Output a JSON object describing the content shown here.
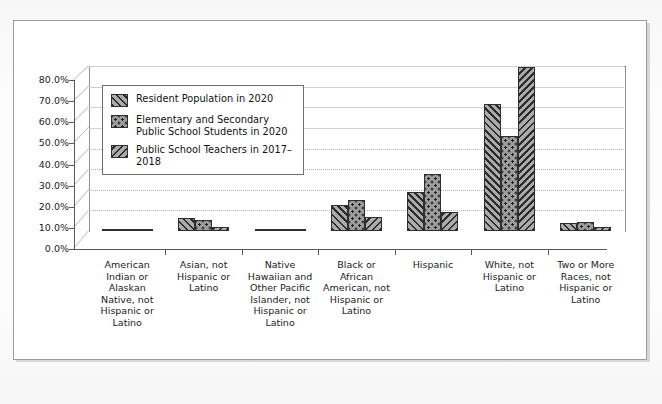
{
  "chart_data": {
    "type": "bar",
    "title": "",
    "xlabel": "",
    "ylabel": "",
    "ylim": [
      0,
      80
    ],
    "grid": true,
    "legend_position": "upper-left-inside",
    "y_ticks": [
      "0.0%",
      "10.0%",
      "20.0%",
      "30.0%",
      "40.0%",
      "50.0%",
      "60.0%",
      "70.0%",
      "80.0%"
    ],
    "categories": [
      "American Indian or Alaskan Native, not Hispanic or Latino",
      "Asian, not Hispanic or Latino",
      "Native Hawaiian and Other Pacific Islander, not Hispanic or Latino",
      "Black or African American, not Hispanic or Latino",
      "Hispanic",
      "White, not Hispanic or Latino",
      "Two or More Races, not Hispanic or Latino"
    ],
    "series": [
      {
        "name": "Resident Population in 2020",
        "pattern": "forward-diagonal",
        "values": [
          0.7,
          6.1,
          0.2,
          12.6,
          18.7,
          61.6,
          4.1
        ]
      },
      {
        "name": "Elementary and Secondary Public School Students in 2020",
        "pattern": "dots",
        "values": [
          1.0,
          5.4,
          0.4,
          15.0,
          27.8,
          46.3,
          4.2
        ]
      },
      {
        "name": "Public School Teachers in 2017–2018",
        "pattern": "backward-diagonal",
        "values": [
          0.4,
          2.1,
          0.2,
          6.7,
          9.0,
          79.3,
          1.8
        ]
      }
    ]
  },
  "legend": {
    "items": [
      "Resident Population in 2020",
      "Elementary and Secondary\nPublic School Students in 2020",
      "Public School Teachers in 2017–2018"
    ]
  }
}
